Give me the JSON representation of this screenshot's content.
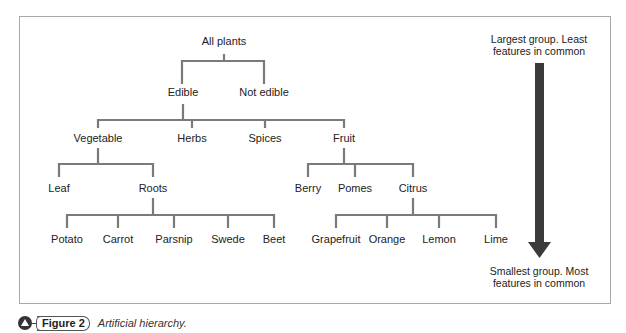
{
  "diagram": {
    "title": "Artificial hierarchy",
    "root": {
      "label": "All plants"
    },
    "nodes": {
      "all_plants": "All plants",
      "edible": "Edible",
      "not_edible": "Not edible",
      "vegetable": "Vegetable",
      "herbs": "Herbs",
      "spices": "Spices",
      "fruit": "Fruit",
      "leaf": "Leaf",
      "roots": "Roots",
      "berry": "Berry",
      "pomes": "Pomes",
      "citrus": "Citrus",
      "potato": "Potato",
      "carrot": "Carrot",
      "parsnip": "Parsnip",
      "swede": "Swede",
      "beet": "Beet",
      "grapefruit": "Grapefruit",
      "orange": "Orange",
      "lemon": "Lemon",
      "lime": "Lime"
    },
    "edges": [
      [
        "All plants",
        "Edible"
      ],
      [
        "All plants",
        "Not edible"
      ],
      [
        "Edible",
        "Vegetable"
      ],
      [
        "Edible",
        "Herbs"
      ],
      [
        "Edible",
        "Spices"
      ],
      [
        "Edible",
        "Fruit"
      ],
      [
        "Vegetable",
        "Leaf"
      ],
      [
        "Vegetable",
        "Roots"
      ],
      [
        "Fruit",
        "Berry"
      ],
      [
        "Fruit",
        "Pomes"
      ],
      [
        "Fruit",
        "Citrus"
      ],
      [
        "Roots",
        "Potato"
      ],
      [
        "Roots",
        "Carrot"
      ],
      [
        "Roots",
        "Parsnip"
      ],
      [
        "Roots",
        "Swede"
      ],
      [
        "Roots",
        "Beet"
      ],
      [
        "Citrus",
        "Grapefruit"
      ],
      [
        "Citrus",
        "Orange"
      ],
      [
        "Citrus",
        "Lemon"
      ],
      [
        "Citrus",
        "Lime"
      ]
    ],
    "arrow": {
      "top_line1": "Largest group. Least",
      "top_line2": "features in common",
      "bottom_line1": "Smallest group. Most",
      "bottom_line2": "features in common"
    },
    "colors": {
      "connector": "#7a7a7a",
      "arrow": "#3a3a3a",
      "border": "#a9a9a9"
    }
  },
  "caption": {
    "figure_label": "Figure 2",
    "text": "Artificial hierarchy."
  }
}
